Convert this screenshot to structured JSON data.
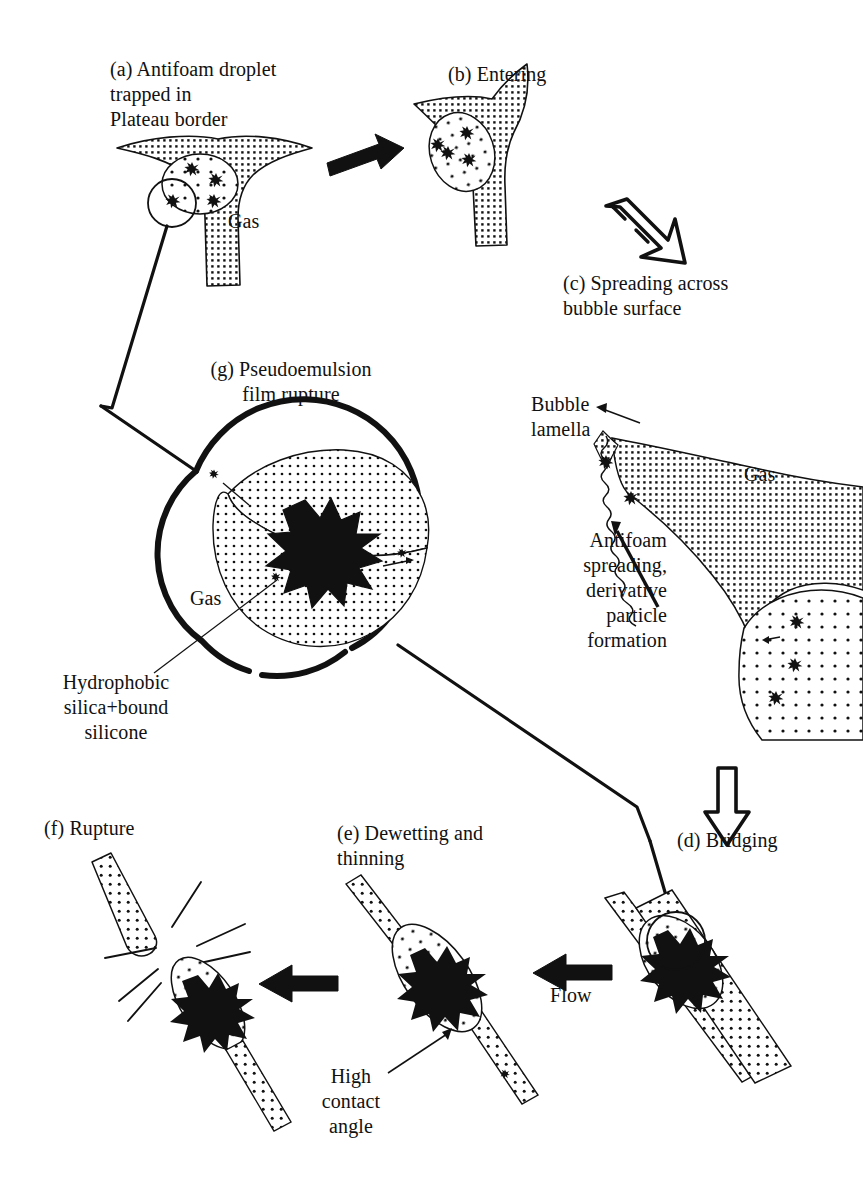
{
  "figure": {
    "background_color": "#ffffff",
    "ink_color": "#111111"
  },
  "labels": {
    "a_caption": "(a) Antifoam droplet\ntrapped in\nPlateau border",
    "a_gas": "Gas",
    "b_caption": "(b) Entering",
    "c_caption": "(c) Spreading across\nbubble surface",
    "g_caption": "(g) Pseudoemulsion\nfilm rupture",
    "g_gas": "Gas",
    "g_silica": "Hydrophobic\nsilica+bound\nsilicone",
    "bubble_lamella": "Bubble\nlamella",
    "antifoam_spreading": "Antifoam\nspreading,\nderivative\nparticle\nformation",
    "right_gas": "Gas",
    "d_caption": "(d) Bridging",
    "e_caption": "(e) Dewetting and\nthinning",
    "e_high_contact_angle": "High\ncontact\nangle",
    "f_caption": "(f) Rupture",
    "flow_right": "Flow",
    "flow_left": "Flow"
  },
  "stages": [
    {
      "id": "a",
      "letter": "(a)",
      "name": "Antifoam droplet trapped in Plateau border"
    },
    {
      "id": "b",
      "letter": "(b)",
      "name": "Entering"
    },
    {
      "id": "c",
      "letter": "(c)",
      "name": "Spreading across bubble surface"
    },
    {
      "id": "d",
      "letter": "(d)",
      "name": "Bridging"
    },
    {
      "id": "e",
      "letter": "(e)",
      "name": "Dewetting and thinning"
    },
    {
      "id": "f",
      "letter": "(f)",
      "name": "Rupture"
    },
    {
      "id": "g",
      "letter": "(g)",
      "name": "Pseudoemulsion film rupture"
    }
  ],
  "icons": {
    "arrow_a_to_b": "solid-right-arrow-icon",
    "arrow_b_to_c": "outline-diagonal-down-right-arrow-icon",
    "arrow_c_to_d": "outline-down-arrow-icon",
    "arrow_d_to_e": "solid-left-arrow-icon",
    "arrow_e_to_f": "solid-left-arrow-icon",
    "leader_a_to_g": "magnifier-leader-line-icon",
    "leader_g_to_d": "magnifier-leader-line-icon",
    "pointer_high_contact_angle": "thin-arrow-icon",
    "pointer_bubble_lamella": "thin-arrow-icon",
    "pointer_antifoam_spreading": "thick-arrow-icon"
  }
}
